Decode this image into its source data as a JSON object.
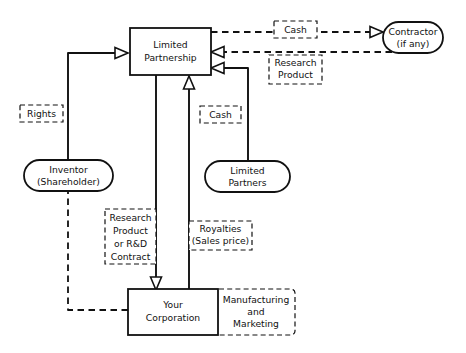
{
  "diagram": {
    "background_color": "#ffffff",
    "line_color": "#111111",
    "nodes": [
      {
        "id": "limited_partnership",
        "shape": "rectangle",
        "style": "solid",
        "lines": [
          "Limited",
          "Partnership"
        ]
      },
      {
        "id": "contractor",
        "shape": "rounded-oval",
        "style": "solid",
        "lines": [
          "Contractor",
          "(if any)"
        ]
      },
      {
        "id": "inventor",
        "shape": "rounded-oval",
        "style": "solid",
        "lines": [
          "Inventor",
          "(Shareholder)"
        ]
      },
      {
        "id": "limited_partners",
        "shape": "rounded-oval",
        "style": "solid",
        "lines": [
          "Limited",
          "Partners"
        ]
      },
      {
        "id": "your_corporation",
        "shape": "rectangle",
        "style": "solid",
        "lines": [
          "Your",
          "Corporation"
        ]
      },
      {
        "id": "manufacturing_marketing",
        "shape": "rounded-rectangle",
        "style": "dashed",
        "lines": [
          "Manufacturing",
          "and",
          "Marketing"
        ]
      }
    ],
    "edge_labels": [
      {
        "id": "cash_to_contractor",
        "lines": [
          "Cash"
        ]
      },
      {
        "id": "research_product_from_contractor",
        "lines": [
          "Research",
          "Product"
        ]
      },
      {
        "id": "rights",
        "lines": [
          "Rights"
        ]
      },
      {
        "id": "cash_from_partners",
        "lines": [
          "Cash"
        ]
      },
      {
        "id": "research_product_rd_contract",
        "lines": [
          "Research",
          "Product",
          "or R&D",
          "Contract"
        ]
      },
      {
        "id": "royalties",
        "lines": [
          "Royalties",
          "(Sales price)"
        ]
      }
    ],
    "edges": [
      {
        "id": "inventor-to-lp",
        "style": "solid",
        "from": "inventor",
        "to": "limited_partnership",
        "label": "Rights",
        "arrow": "to"
      },
      {
        "id": "lp-to-contractor",
        "style": "dashed",
        "from": "limited_partnership",
        "to": "contractor",
        "label": "Cash",
        "arrow": "to"
      },
      {
        "id": "contractor-to-lp",
        "style": "dashed",
        "from": "contractor",
        "to": "limited_partnership",
        "label": "Research Product",
        "arrow": "to"
      },
      {
        "id": "partners-to-lp",
        "style": "solid",
        "from": "limited_partners",
        "to": "limited_partnership",
        "label": "Cash",
        "arrow": "to"
      },
      {
        "id": "lp-to-corp",
        "style": "solid",
        "from": "limited_partnership",
        "to": "your_corporation",
        "label": "Research Product or R&D Contract",
        "arrow": "to"
      },
      {
        "id": "corp-to-lp",
        "style": "solid",
        "from": "your_corporation",
        "to": "limited_partnership",
        "label": "Royalties (Sales price)",
        "arrow": "to"
      },
      {
        "id": "corp-to-inventor",
        "style": "dashed",
        "from": "your_corporation",
        "to": "inventor",
        "label": "",
        "arrow": "none"
      }
    ]
  }
}
